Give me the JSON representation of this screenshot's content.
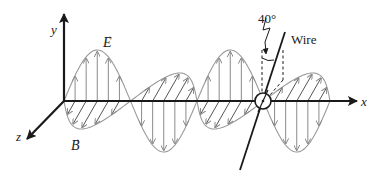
{
  "diagram": {
    "axes": {
      "x_label": "x",
      "y_label": "y",
      "z_label": "z"
    },
    "fields": {
      "electric_label": "E",
      "magnetic_label": "B",
      "vector_mark": "→"
    },
    "wire": {
      "label": "Wire",
      "angle_label": "40°",
      "angle_deg": 40
    },
    "colors": {
      "axis": "#1a1a1a",
      "wave_outline": "#9a9a9a",
      "field_arrows": "#8a8a8a",
      "wire": "#1a1a1a",
      "text": "#222222"
    }
  }
}
